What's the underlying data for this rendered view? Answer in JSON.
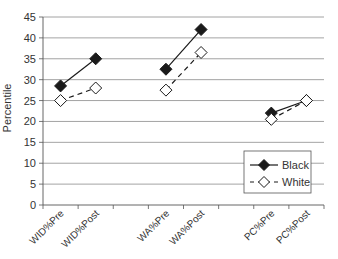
{
  "chart_data": {
    "type": "line",
    "title": "",
    "xlabel": "",
    "ylabel": "Percentile",
    "ylim": [
      0,
      45
    ],
    "yticks": [
      0,
      5,
      10,
      15,
      20,
      25,
      30,
      35,
      40,
      45
    ],
    "grid": true,
    "legend_position": "lower right (inside plot)",
    "categories": [
      "WID%Pre",
      "WID%Post",
      "",
      "WA%Pre",
      "WA%Post",
      "",
      "PC%Pre",
      "PC%Post"
    ],
    "series": [
      {
        "name": "Black",
        "marker": "filled-diamond",
        "line_style": "solid",
        "color": "#1a1a1a",
        "values": [
          28.5,
          35,
          null,
          32.5,
          42,
          null,
          22,
          25
        ]
      },
      {
        "name": "White",
        "marker": "open-diamond",
        "line_style": "dashed",
        "color": "#1a1a1a",
        "values": [
          25,
          28,
          null,
          27.5,
          36.5,
          null,
          20.5,
          25
        ]
      }
    ]
  },
  "legend": {
    "items": [
      {
        "label": "Black"
      },
      {
        "label": "White"
      }
    ]
  },
  "colors": {
    "grid": "#8c8c8c",
    "axis": "#555555",
    "series": "#1a1a1a",
    "background": "#ffffff"
  }
}
